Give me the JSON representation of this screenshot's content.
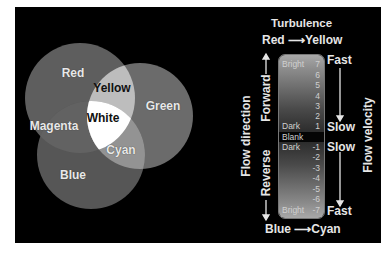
{
  "venn": {
    "circles": [
      {
        "name": "Red",
        "cx": 80,
        "cy": 98,
        "r": 55,
        "fill": "#5e5e5e"
      },
      {
        "name": "Green",
        "cx": 140,
        "cy": 116,
        "r": 53,
        "fill": "#6a6a6a"
      },
      {
        "name": "Blue",
        "cx": 91,
        "cy": 155,
        "r": 54,
        "fill": "#555555"
      }
    ],
    "labels": {
      "red": "Red",
      "green": "Green",
      "blue": "Blue",
      "yellow": "Yellow",
      "magenta": "Magenta",
      "cyan": "Cyan",
      "white": "White"
    }
  },
  "legend": {
    "title": "Turbulence",
    "top_mapping": {
      "from": "Red",
      "arrow": "⟶",
      "to": "Yellow"
    },
    "bottom_mapping": {
      "from": "Blue",
      "arrow": "⟶",
      "to": "Cyan"
    },
    "left_axis": {
      "label": "Flow direction",
      "forward": "Forward",
      "reverse": "Reverse"
    },
    "right_axis": {
      "label": "Flow velocity",
      "top_fast": "Fast",
      "upper_slow": "Slow",
      "lower_slow": "Slow",
      "bottom_fast": "Fast"
    },
    "scale": [
      {
        "word": "Bright",
        "num": "7"
      },
      {
        "word": "",
        "num": "6"
      },
      {
        "word": "",
        "num": "5"
      },
      {
        "word": "",
        "num": "4"
      },
      {
        "word": "",
        "num": "3"
      },
      {
        "word": "",
        "num": "2"
      },
      {
        "word": "Dark",
        "num": "1"
      },
      {
        "word": "Blank",
        "num": ""
      },
      {
        "word": "Dark",
        "num": "-1"
      },
      {
        "word": "",
        "num": "-2"
      },
      {
        "word": "",
        "num": "-3"
      },
      {
        "word": "",
        "num": "-4"
      },
      {
        "word": "",
        "num": "-5"
      },
      {
        "word": "",
        "num": "-6"
      },
      {
        "word": "Bright",
        "num": "-7"
      }
    ]
  }
}
